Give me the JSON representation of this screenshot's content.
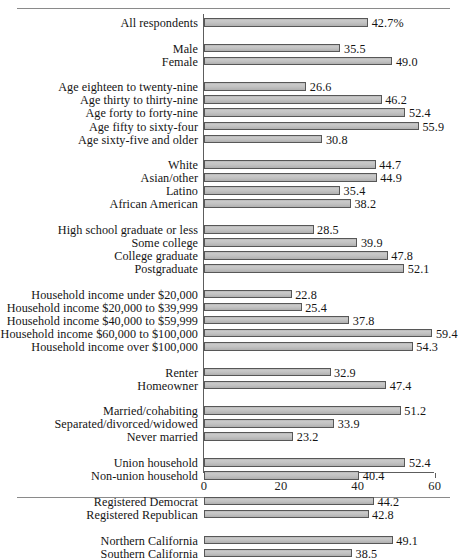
{
  "figure": {
    "has_top_rule": true,
    "has_bottom_rule": true,
    "background": "#ffffff",
    "bar_fill": "#c2c2c2",
    "bar_edge": "#575757",
    "axis_color": "#5d5d5d"
  },
  "chart_data": {
    "type": "bar",
    "orientation": "horizontal",
    "title": "",
    "subtitle": "",
    "xlabel": "",
    "ylabel": "",
    "xlim": [
      0,
      60
    ],
    "xticks": [
      0,
      20,
      40,
      60
    ],
    "xtick_labels": [
      "0",
      "20",
      "40",
      "60"
    ],
    "grid": false,
    "legend": "none",
    "value_label_suffix_first": "%",
    "categories": [
      "All respondents",
      "Male",
      "Female",
      "Age eighteen to twenty-nine",
      "Age thirty to thirty-nine",
      "Age forty to forty-nine",
      "Age fifty to sixty-four",
      "Age sixty-five and older",
      "White",
      "Asian/other",
      "Latino",
      "African American",
      "High school graduate or less",
      "Some college",
      "College graduate",
      "Postgraduate",
      "Household income under $20,000",
      "Household income $20,000 to $39,999",
      "Household income $40,000 to $59,999",
      "Household income $60,000 to $100,000",
      "Household income over $100,000",
      "Renter",
      "Homeowner",
      "Married/cohabiting",
      "Separated/divorced/widowed",
      "Never married",
      "Union household",
      "Non-union household",
      "Registered Democrat",
      "Registered Republican",
      "Northern California",
      "Southern California"
    ],
    "values": [
      42.7,
      35.5,
      49.0,
      26.6,
      46.2,
      52.4,
      55.9,
      30.8,
      44.7,
      44.9,
      35.4,
      38.2,
      28.5,
      39.9,
      47.8,
      52.1,
      22.8,
      25.4,
      37.8,
      59.4,
      54.3,
      32.9,
      47.4,
      51.2,
      33.9,
      23.2,
      52.4,
      40.4,
      44.2,
      42.8,
      49.1,
      38.5
    ],
    "value_labels": [
      "42.7%",
      "35.5",
      "49.0",
      "26.6",
      "46.2",
      "52.4",
      "55.9",
      "30.8",
      "44.7",
      "44.9",
      "35.4",
      "38.2",
      "28.5",
      "39.9",
      "47.8",
      "52.1",
      "22.8",
      "25.4",
      "37.8",
      "59.4",
      "54.3",
      "32.9",
      "47.4",
      "51.2",
      "33.9",
      "23.2",
      "52.4",
      "40.4",
      "44.2",
      "42.8",
      "49.1",
      "38.5"
    ],
    "groups": [
      {
        "name": "overall",
        "size": 1
      },
      {
        "name": "gender",
        "size": 2
      },
      {
        "name": "age",
        "size": 5
      },
      {
        "name": "race-ethnicity",
        "size": 4
      },
      {
        "name": "education",
        "size": 4
      },
      {
        "name": "household-income",
        "size": 5
      },
      {
        "name": "housing-tenure",
        "size": 2
      },
      {
        "name": "marital-status",
        "size": 3
      },
      {
        "name": "union-membership",
        "size": 2
      },
      {
        "name": "party-registration",
        "size": 2
      },
      {
        "name": "region",
        "size": 2
      }
    ]
  }
}
